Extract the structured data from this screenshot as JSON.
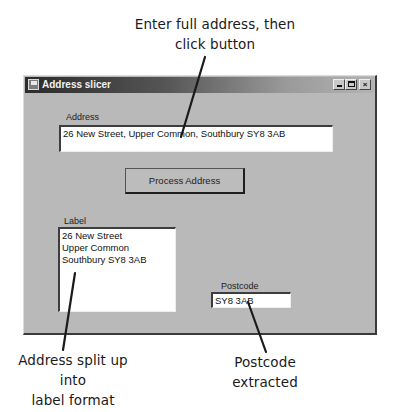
{
  "annotations": {
    "top": [
      "Enter full address, then",
      "click button"
    ],
    "bottom_left": [
      "Address split up into",
      "label format"
    ],
    "bottom_right": [
      "Postcode",
      "extracted"
    ]
  },
  "window": {
    "title": "Address slicer",
    "icon": "app-window-icon",
    "controls": {
      "minimize": "minimize-icon",
      "maximize": "maximize-icon",
      "close": "×"
    }
  },
  "form": {
    "address": {
      "label": "Address",
      "value": "26 New Street, Upper Common, Southbury SY8 3AB"
    },
    "process_button": {
      "label": "Process Address"
    },
    "label_output": {
      "label": "Label",
      "lines": [
        "26 New Street",
        "Upper Common",
        "Southbury SY8 3AB"
      ]
    },
    "postcode": {
      "label": "Postcode",
      "value": "SY8 3AB"
    }
  }
}
